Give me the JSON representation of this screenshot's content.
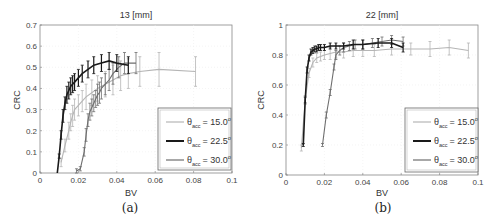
{
  "chart_data": [
    {
      "type": "line",
      "panel_label": "(a)",
      "title": "13 [mm]",
      "xlabel": "BV",
      "ylabel": "CRC",
      "xlim": [
        0,
        0.1
      ],
      "ylim": [
        0,
        0.7
      ],
      "xticks": [
        "0",
        "0.02",
        "0.04",
        "0.06",
        "0.08",
        "0.1"
      ],
      "yticks": [
        "0",
        "0.1",
        "0.2",
        "0.3",
        "0.4",
        "0.5",
        "0.6",
        "0.7"
      ],
      "grid": true,
      "legend_position": "lower right",
      "error_bars": true,
      "series": [
        {
          "name": "θacc = 15.0°",
          "color": "#b5b5b5",
          "x": [
            0.011,
            0.013,
            0.015,
            0.016,
            0.017,
            0.018,
            0.02,
            0.022,
            0.024,
            0.027,
            0.03,
            0.034,
            0.038,
            0.042,
            0.046,
            0.052,
            0.062,
            0.081
          ],
          "y": [
            0.05,
            0.13,
            0.2,
            0.24,
            0.27,
            0.3,
            0.32,
            0.34,
            0.36,
            0.38,
            0.4,
            0.42,
            0.44,
            0.46,
            0.47,
            0.48,
            0.49,
            0.48
          ],
          "err": [
            0.02,
            0.03,
            0.04,
            0.04,
            0.05,
            0.05,
            0.05,
            0.05,
            0.06,
            0.06,
            0.06,
            0.06,
            0.07,
            0.07,
            0.07,
            0.07,
            0.08,
            0.07
          ]
        },
        {
          "name": "θacc = 22.5°",
          "color": "#1a1a1a",
          "x": [
            0.009,
            0.01,
            0.011,
            0.012,
            0.013,
            0.014,
            0.015,
            0.016,
            0.017,
            0.018,
            0.02,
            0.022,
            0.025,
            0.028,
            0.032,
            0.036,
            0.04,
            0.046
          ],
          "y": [
            0.0,
            0.08,
            0.18,
            0.27,
            0.33,
            0.37,
            0.39,
            0.41,
            0.42,
            0.43,
            0.45,
            0.47,
            0.49,
            0.51,
            0.52,
            0.53,
            0.52,
            0.51
          ],
          "err": [
            0.0,
            0.01,
            0.02,
            0.03,
            0.03,
            0.04,
            0.04,
            0.04,
            0.04,
            0.04,
            0.04,
            0.04,
            0.04,
            0.04,
            0.04,
            0.04,
            0.04,
            0.04
          ]
        },
        {
          "name": "θacc = 30.0°",
          "color": "#6e6e6e",
          "x": [
            0.019,
            0.021,
            0.023,
            0.024,
            0.025,
            0.026,
            0.027,
            0.028,
            0.029,
            0.03,
            0.031,
            0.032,
            0.034,
            0.036,
            0.038,
            0.041,
            0.044,
            0.05
          ],
          "y": [
            0.01,
            0.02,
            0.1,
            0.18,
            0.25,
            0.29,
            0.31,
            0.33,
            0.35,
            0.37,
            0.38,
            0.4,
            0.42,
            0.44,
            0.47,
            0.5,
            0.52,
            0.52
          ],
          "err": [
            0.01,
            0.01,
            0.02,
            0.03,
            0.03,
            0.04,
            0.04,
            0.04,
            0.04,
            0.05,
            0.05,
            0.05,
            0.05,
            0.05,
            0.05,
            0.05,
            0.05,
            0.05
          ]
        }
      ]
    },
    {
      "type": "line",
      "panel_label": "(b)",
      "title": "22 [mm]",
      "xlabel": "BV",
      "ylabel": "CRC",
      "xlim": [
        0,
        0.1
      ],
      "ylim": [
        0,
        1
      ],
      "xticks": [
        "0",
        "0.02",
        "0.04",
        "0.06",
        "0.08",
        "0.1"
      ],
      "yticks": [
        "0",
        "0.2",
        "0.4",
        "0.6",
        "0.8",
        "1"
      ],
      "grid": true,
      "legend_position": "lower right",
      "error_bars": true,
      "series": [
        {
          "name": "θacc = 15.0°",
          "color": "#b5b5b5",
          "x": [
            0.008,
            0.01,
            0.012,
            0.014,
            0.016,
            0.018,
            0.02,
            0.023,
            0.026,
            0.03,
            0.035,
            0.04,
            0.046,
            0.055,
            0.065,
            0.075,
            0.085,
            0.095
          ],
          "y": [
            0.18,
            0.5,
            0.68,
            0.75,
            0.78,
            0.79,
            0.8,
            0.81,
            0.82,
            0.82,
            0.83,
            0.83,
            0.83,
            0.84,
            0.84,
            0.84,
            0.85,
            0.83
          ],
          "err": [
            0.02,
            0.03,
            0.03,
            0.03,
            0.03,
            0.03,
            0.03,
            0.04,
            0.04,
            0.04,
            0.04,
            0.04,
            0.04,
            0.04,
            0.04,
            0.05,
            0.05,
            0.05
          ]
        },
        {
          "name": "θacc = 22.5°",
          "color": "#1a1a1a",
          "x": [
            0.009,
            0.01,
            0.011,
            0.012,
            0.013,
            0.014,
            0.015,
            0.016,
            0.017,
            0.018,
            0.02,
            0.023,
            0.026,
            0.03,
            0.035,
            0.04,
            0.048,
            0.055,
            0.061
          ],
          "y": [
            0.2,
            0.5,
            0.7,
            0.78,
            0.82,
            0.83,
            0.84,
            0.84,
            0.85,
            0.85,
            0.85,
            0.86,
            0.86,
            0.86,
            0.87,
            0.87,
            0.88,
            0.88,
            0.85
          ],
          "err": [
            0.01,
            0.02,
            0.02,
            0.02,
            0.02,
            0.02,
            0.02,
            0.02,
            0.02,
            0.02,
            0.02,
            0.02,
            0.02,
            0.02,
            0.03,
            0.03,
            0.03,
            0.03,
            0.03
          ]
        },
        {
          "name": "θacc = 30.0°",
          "color": "#6e6e6e",
          "x": [
            0.019,
            0.021,
            0.023,
            0.025,
            0.026,
            0.028,
            0.03,
            0.033,
            0.036,
            0.04,
            0.045,
            0.05,
            0.055,
            0.061
          ],
          "y": [
            0.2,
            0.4,
            0.55,
            0.72,
            0.8,
            0.83,
            0.85,
            0.86,
            0.87,
            0.87,
            0.88,
            0.89,
            0.9,
            0.89
          ],
          "err": [
            0.01,
            0.02,
            0.02,
            0.02,
            0.03,
            0.03,
            0.03,
            0.03,
            0.03,
            0.03,
            0.03,
            0.03,
            0.03,
            0.03
          ]
        }
      ]
    }
  ],
  "panels": {
    "a": {
      "title": "13 [mm]",
      "xlabel": "BV",
      "ylabel": "CRC",
      "caption": "(a)",
      "legend": [
        {
          "theta": "θ",
          "sub": "acc",
          "value": "= 15.0",
          "deg": "o"
        },
        {
          "theta": "θ",
          "sub": "acc",
          "value": "= 22.5",
          "deg": "o"
        },
        {
          "theta": "θ",
          "sub": "acc",
          "value": "= 30.0",
          "deg": "o"
        }
      ]
    },
    "b": {
      "title": "22 [mm]",
      "xlabel": "BV",
      "ylabel": "CRC",
      "caption": "(b)",
      "legend": [
        {
          "theta": "θ",
          "sub": "acc",
          "value": "= 15.0",
          "deg": "o"
        },
        {
          "theta": "θ",
          "sub": "acc",
          "value": "= 22.5",
          "deg": "o"
        },
        {
          "theta": "θ",
          "sub": "acc",
          "value": "= 30.0",
          "deg": "o"
        }
      ]
    }
  }
}
